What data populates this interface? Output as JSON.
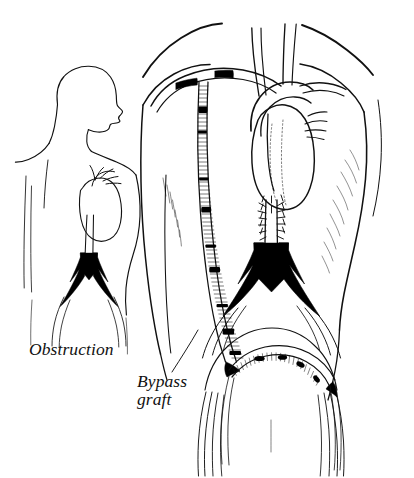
{
  "figure": {
    "background_color": "#ffffff",
    "ink_color": "#111111",
    "width": 414,
    "height": 478
  },
  "labels": {
    "obstruction": "Obstruction",
    "bypass_graft_line1": "Bypass",
    "bypass_graft_line2": "graft"
  },
  "panels": {
    "inset": {
      "name": "small-figure-inset",
      "description": "Small outline figure, head in profile facing right, with heart and aorta, showing black obstructed aortic bifurcation",
      "label_ref": "obstruction"
    },
    "main": {
      "name": "main-figure",
      "description": "Large torso with heart, great vessels, black obstructed aortic bifurcation and corrugated axillofemoral bypass graft",
      "label_ref": "bypass_graft"
    }
  },
  "anatomy": {
    "inset_parts": [
      "head-profile",
      "neck",
      "shoulders",
      "left-arm",
      "right-arm",
      "torso",
      "heart",
      "aortic-arch",
      "great-vessels",
      "descending-aorta",
      "obstructed-bifurcation",
      "iliac-arteries"
    ],
    "main_parts": [
      "shoulders",
      "left-arm",
      "right-arm",
      "torso",
      "heart",
      "aortic-arch",
      "great-vessels",
      "axillary-artery",
      "descending-aorta",
      "calcified-aorta",
      "obstructed-bifurcation",
      "iliac-arteries",
      "femoral-arteries",
      "bypass-graft-tube",
      "graft-crossover-limb",
      "proximal-anastomosis",
      "distal-anastomosis"
    ]
  },
  "colors": {
    "obstruction_fill": "#000000",
    "outline": "#111111",
    "graft_outline": "#2a2a2a",
    "background": "#ffffff"
  }
}
